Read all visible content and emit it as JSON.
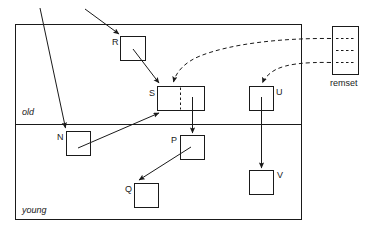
{
  "diagram": {
    "regions": [
      {
        "id": "old",
        "label": "old"
      },
      {
        "id": "young",
        "label": "young"
      }
    ],
    "side_structure": {
      "id": "remset",
      "label": "remset",
      "entries": 3
    },
    "nodes": [
      {
        "id": "R",
        "label": "R",
        "region": "old"
      },
      {
        "id": "S",
        "label": "S",
        "region": "old",
        "split": true
      },
      {
        "id": "U",
        "label": "U",
        "region": "old"
      },
      {
        "id": "N",
        "label": "N",
        "region": "young"
      },
      {
        "id": "P",
        "label": "P",
        "region": "young"
      },
      {
        "id": "Q",
        "label": "Q",
        "region": "young"
      },
      {
        "id": "V",
        "label": "V",
        "region": "young"
      }
    ],
    "edges": [
      {
        "from": "root-external-1",
        "to": "N",
        "style": "solid"
      },
      {
        "from": "root-external-2",
        "to": "R",
        "style": "solid"
      },
      {
        "from": "R",
        "to": "S",
        "style": "solid"
      },
      {
        "from": "N",
        "to": "S",
        "style": "solid"
      },
      {
        "from": "S",
        "to": "P",
        "style": "solid"
      },
      {
        "from": "P",
        "to": "Q",
        "style": "solid"
      },
      {
        "from": "U",
        "to": "V",
        "style": "solid"
      },
      {
        "from": "remset",
        "to": "S",
        "style": "dashed"
      },
      {
        "from": "remset",
        "to": "U",
        "style": "dashed"
      }
    ],
    "colors": {
      "stroke": "#1a1a1a",
      "background": "#ffffff"
    }
  }
}
